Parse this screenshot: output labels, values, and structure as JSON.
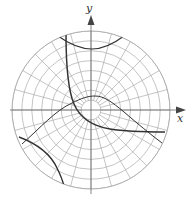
{
  "diagram": {
    "type": "polar-grid-with-curves",
    "axes": {
      "x_label": "x",
      "y_label": "y"
    },
    "grid": {
      "center": [
        91,
        110
      ],
      "radius": 79,
      "circle_count": 8,
      "radial_line_count": 24,
      "color": "#aaaaaa"
    },
    "curves": [
      {
        "name": "hyperbola-main-branch",
        "description": "curve from top-left descending to bottom-right asymptotically along axes"
      },
      {
        "name": "hyperbola-top-arc",
        "description": "upward opening arc near top of disk"
      },
      {
        "name": "hyperbola-bottom-left-arc",
        "description": "arc in lower-left corner of disk"
      },
      {
        "name": "bell-curve-line",
        "description": "curve rising from lower-left over center and descending to lower-right"
      }
    ],
    "curve_color": "#333333"
  }
}
